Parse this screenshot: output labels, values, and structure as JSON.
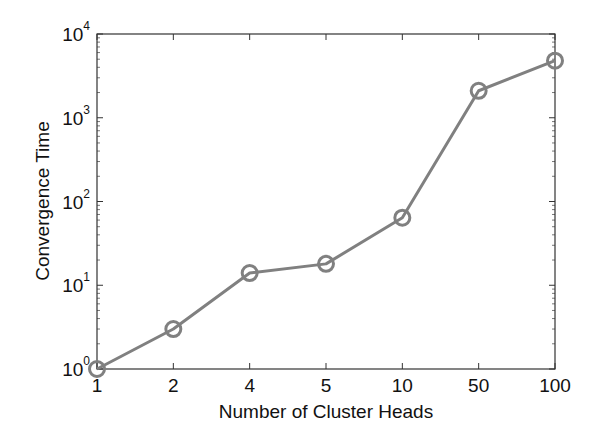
{
  "chart_data": {
    "type": "line",
    "title": "",
    "xlabel": "Number of Cluster Heads",
    "ylabel": "Convergence Time",
    "x_scale": "categorical",
    "y_scale": "log",
    "categories": [
      "1",
      "2",
      "4",
      "5",
      "10",
      "50",
      "100"
    ],
    "series": [
      {
        "name": "Convergence Time",
        "marker": "circle",
        "color": "#808080",
        "values": [
          1,
          3,
          14,
          18,
          64,
          2100,
          4800
        ]
      }
    ],
    "ylim": [
      1,
      10000
    ],
    "y_ticks": [
      {
        "base": "10",
        "exp": "0",
        "value": 1
      },
      {
        "base": "10",
        "exp": "1",
        "value": 10
      },
      {
        "base": "10",
        "exp": "2",
        "value": 100
      },
      {
        "base": "10",
        "exp": "3",
        "value": 1000
      },
      {
        "base": "10",
        "exp": "4",
        "value": 10000
      }
    ],
    "grid": false,
    "legend": null
  },
  "colors": {
    "series": "#808080",
    "axes": "#333333",
    "text": "#111111",
    "background": "#ffffff"
  }
}
